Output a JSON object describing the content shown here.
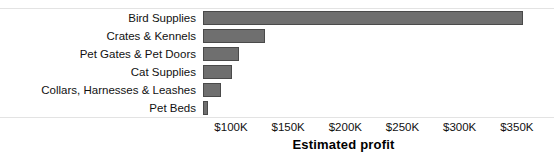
{
  "chart_data": {
    "type": "bar",
    "orientation": "horizontal",
    "title": "",
    "xlabel": "Estimated profit",
    "ylabel": "",
    "categories": [
      "Bird Supplies",
      "Crates & Kennels",
      "Pet Gates & Pet Doors",
      "Cat Supplies",
      "Collars, Harnesses & Leashes",
      "Pet Beds"
    ],
    "values": [
      355000,
      130000,
      107000,
      101000,
      91000,
      80000
    ],
    "value_unit": "USD",
    "xlim": [
      75500,
      382500
    ],
    "xticks": [
      100000,
      150000,
      200000,
      250000,
      300000,
      350000
    ],
    "xtick_labels": [
      "$100K",
      "$150K",
      "$200K",
      "$250K",
      "$300K",
      "$350K"
    ],
    "grid": false,
    "legend": null,
    "bar_color": "#6f6f6f",
    "bar_border_color": "#4a4a4a",
    "frame_color": "#e3e3e3",
    "background_color": "#ffffff",
    "text_color": "#111111"
  }
}
